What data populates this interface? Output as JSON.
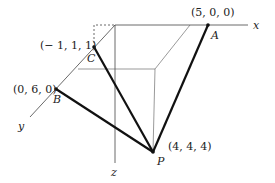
{
  "diagram": {
    "axes": {
      "x_label": "x",
      "y_label": "y",
      "z_label": "z"
    },
    "points": {
      "A": {
        "name": "A",
        "coords": "(5, 0, 0)"
      },
      "B": {
        "name": "B",
        "coords": "(0, 6, 0)"
      },
      "C": {
        "name": "C",
        "coords": "(− 1, 1, 1)"
      },
      "P": {
        "name": "P",
        "coords": "(4, 4, 4)"
      }
    },
    "colors": {
      "thick_line": "#111111",
      "thin_line": "#444444"
    }
  }
}
